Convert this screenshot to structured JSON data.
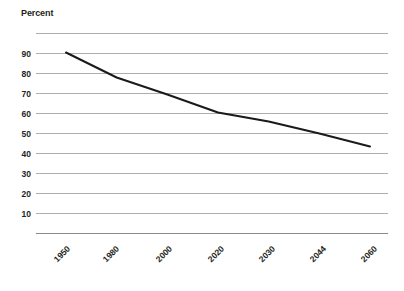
{
  "chart_data": {
    "type": "line",
    "title": "Percent",
    "xlabel": "",
    "ylabel": "",
    "categories": [
      "1950",
      "1980",
      "2000",
      "2020",
      "2030",
      "2044",
      "2060"
    ],
    "values": [
      90.5,
      78.0,
      69.5,
      60.5,
      56.0,
      50.0,
      43.5
    ],
    "series": [
      {
        "name": "Percent",
        "values": [
          90.5,
          78.0,
          69.5,
          60.5,
          56.0,
          50.0,
          43.5
        ],
        "color": "#1a1a1a"
      }
    ],
    "ylim": [
      0,
      100
    ],
    "ytick_labels": [
      "90",
      "80",
      "70",
      "60",
      "50",
      "40",
      "30",
      "20",
      "10"
    ],
    "ytick_values": [
      90,
      80,
      70,
      60,
      50,
      40,
      30,
      20,
      10
    ],
    "gridline_values": [
      100,
      90,
      80,
      70,
      60,
      50,
      40,
      30,
      20,
      10,
      0
    ],
    "grid": true,
    "grid_orientation": "horizontal",
    "legend": false,
    "legend_position": "none",
    "xtick_rotation_degrees": 45,
    "colors": {
      "line": "#1a1a1a",
      "gridline": "#9a9a9a",
      "axis": "#7d7d7d",
      "text": "#231f20",
      "background": "#ffffff"
    }
  }
}
